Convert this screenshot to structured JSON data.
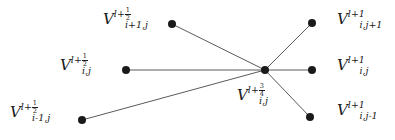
{
  "figure": {
    "name": "finite-difference-stencil",
    "background_color": "#ffffff",
    "edge_color": "#5a5a5a",
    "node_color": "#1a1a1a"
  },
  "nodes": [
    {
      "id": "center",
      "x": 265,
      "y": 70,
      "label_id": "center"
    },
    {
      "id": "upper-left",
      "x": 172,
      "y": 24,
      "label_id": "upper-left"
    },
    {
      "id": "middle-left",
      "x": 126,
      "y": 70,
      "label_id": "middle-left"
    },
    {
      "id": "lower-left",
      "x": 82,
      "y": 120,
      "label_id": "lower-left"
    },
    {
      "id": "upper-right",
      "x": 312,
      "y": 23,
      "label_id": "upper-right"
    },
    {
      "id": "middle-right",
      "x": 312,
      "y": 70,
      "label_id": "middle-right"
    },
    {
      "id": "lower-right",
      "x": 310,
      "y": 117,
      "label_id": "lower-right"
    }
  ],
  "edges": [
    {
      "from": "upper-left",
      "to": "center"
    },
    {
      "from": "middle-left",
      "to": "center"
    },
    {
      "from": "lower-left",
      "to": "center"
    },
    {
      "from": "center",
      "to": "upper-right"
    },
    {
      "from": "center",
      "to": "middle-right"
    },
    {
      "from": "center",
      "to": "lower-right"
    }
  ],
  "labels": {
    "upper_left": {
      "base": "V",
      "subscript": "i+1,j",
      "superscript_base": "l+",
      "superscript_num": "1",
      "superscript_den": "2",
      "text": "V_{i+1,j}^{l+1/2}",
      "x": 103,
      "y": 12
    },
    "middle_left": {
      "base": "V",
      "subscript": "i,j",
      "superscript_base": "l+",
      "superscript_num": "1",
      "superscript_den": "2",
      "text": "V_{i,j}^{l+1/2}",
      "x": 60,
      "y": 58
    },
    "lower_left": {
      "base": "V",
      "subscript": "i-1,j",
      "superscript_base": "l+",
      "superscript_num": "1",
      "superscript_den": "2",
      "text": "V_{i-1,j}^{l+1/2}",
      "x": 10,
      "y": 105
    },
    "center": {
      "base": "V",
      "subscript": "i,j",
      "superscript_base": "l+",
      "superscript_num": "3",
      "superscript_den": "4",
      "text": "V_{i,j}^{l+3/4}",
      "x": 237,
      "y": 88
    },
    "upper_right": {
      "base": "V",
      "subscript": "i,j+1",
      "superscript_base": "l+1",
      "superscript_num": "",
      "superscript_den": "",
      "text": "V_{i,j+1}^{l+1}",
      "x": 337,
      "y": 12
    },
    "middle_right": {
      "base": "V",
      "subscript": "i,j",
      "superscript_base": "l+1",
      "superscript_num": "",
      "superscript_den": "",
      "text": "V_{i,j}^{l+1}",
      "x": 337,
      "y": 58
    },
    "lower_right": {
      "base": "V",
      "subscript": "i,j-1",
      "superscript_base": "l+1",
      "superscript_num": "",
      "superscript_den": "",
      "text": "V_{i,j-1}^{l+1}",
      "x": 337,
      "y": 103
    }
  }
}
